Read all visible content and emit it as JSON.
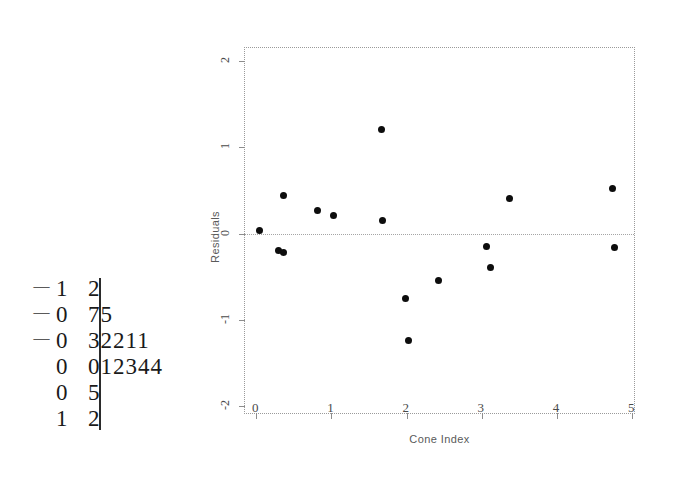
{
  "chart_data": [
    {
      "type": "scatter",
      "title": "",
      "xlabel": "Cone Index",
      "ylabel": "Residuals",
      "xlim": [
        -0.15,
        5.05
      ],
      "ylim": [
        -2.1,
        2.15
      ],
      "xticks": [
        "0",
        "1",
        "2",
        "3",
        "4",
        "5"
      ],
      "xtick_values": [
        0,
        1,
        2,
        3,
        4,
        5
      ],
      "yticks": [
        "2",
        "1",
        "0",
        "-1",
        "-2"
      ],
      "ytick_values": [
        2,
        1,
        0,
        -1,
        -2
      ],
      "grid": false,
      "legend": null,
      "reference_line": {
        "orientation": "horizontal",
        "y": 0,
        "style": "dotted"
      },
      "marker": {
        "shape": "circle",
        "color": "#0d0d0d",
        "size": 7
      },
      "points": [
        {
          "x": 0.04,
          "y": 0.04
        },
        {
          "x": 0.3,
          "y": -0.2
        },
        {
          "x": 0.36,
          "y": -0.22
        },
        {
          "x": 0.36,
          "y": 0.44
        },
        {
          "x": 0.82,
          "y": 0.27
        },
        {
          "x": 1.03,
          "y": 0.21
        },
        {
          "x": 1.66,
          "y": 1.21
        },
        {
          "x": 1.68,
          "y": 0.15
        },
        {
          "x": 1.99,
          "y": -0.75
        },
        {
          "x": 2.02,
          "y": -1.24
        },
        {
          "x": 2.42,
          "y": -0.54
        },
        {
          "x": 3.06,
          "y": -0.15
        },
        {
          "x": 3.11,
          "y": -0.39
        },
        {
          "x": 3.37,
          "y": 0.41
        },
        {
          "x": 4.74,
          "y": 0.52
        },
        {
          "x": 4.77,
          "y": -0.16
        }
      ]
    },
    {
      "type": "table",
      "title": "",
      "stem_leaf": {
        "rows": [
          {
            "sign": "—",
            "stem": "1",
            "leaves": "2"
          },
          {
            "sign": "—",
            "stem": "0",
            "leaves": "75"
          },
          {
            "sign": "—",
            "stem": "0",
            "leaves": "32211"
          },
          {
            "sign": "",
            "stem": "0",
            "leaves": "012344"
          },
          {
            "sign": "",
            "stem": "0",
            "leaves": "5"
          },
          {
            "sign": "",
            "stem": "1",
            "leaves": "2"
          }
        ]
      }
    }
  ]
}
